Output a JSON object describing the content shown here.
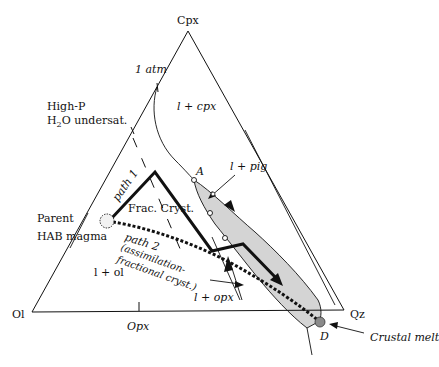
{
  "diagram": {
    "type": "ternary-phase-diagram",
    "vertices": {
      "top": "Cpx",
      "left": "Ol",
      "right": "Qz"
    },
    "edge_labels": {
      "bottom_mid": "Opx"
    },
    "labels": {
      "one_atm": "1 atm",
      "high_p_line1": "High-P",
      "high_p_line2_prefix": "H",
      "high_p_line2_sub": "2",
      "high_p_line2_suffix": "O undersat.",
      "l_cpx": "l + cpx",
      "l_pig": "l + pig",
      "point_a": "A",
      "path1": "path 1",
      "frac_cryst": "Frac. Cryst.",
      "parent_line1": "Parent",
      "parent_line2": "HAB magma",
      "path2": "path 2",
      "path2_desc1": "(assimilation-",
      "path2_desc2": "fractional cryst.)",
      "l_ol": "l + ol",
      "l_opx": "l + opx",
      "point_d": "D",
      "crustal_melt": "Crustal melt"
    },
    "colors": {
      "line": "#111111",
      "field_fill": "#d4d4d4",
      "crustal_melt_dot": "#8a8a8a",
      "parent_dot": "#f2f2f2"
    }
  }
}
